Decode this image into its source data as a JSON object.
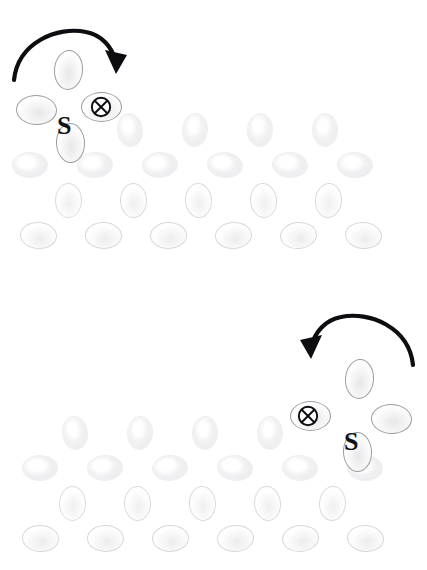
{
  "figure": {
    "width": 427,
    "height": 570,
    "background_color": "#ffffff",
    "panel_count": 2
  },
  "symbols": {
    "s_label": "S",
    "cross_circle_label": "⊗",
    "cross_circle_name": "into-page-vector",
    "stroke_color": "#111115"
  },
  "panels": [
    {
      "id": "panel-top",
      "name": "top-panel",
      "origin_y": 0,
      "arrow": {
        "name": "clockwise-rotation-arrow",
        "direction": "clockwise",
        "head_points": "down-right",
        "start": [
          14,
          77
        ],
        "end": [
          113,
          80
        ],
        "apex": [
          62,
          33
        ]
      },
      "s_marker": {
        "x": 57,
        "y": 113,
        "text": "S"
      },
      "cross_marker": {
        "x": 90,
        "y": 96,
        "text": "⊗"
      },
      "emphasis_cells": [
        {
          "shape": "v",
          "cx": 68,
          "cy": 70
        },
        {
          "shape": "h",
          "cx": 36,
          "cy": 110
        },
        {
          "shape": "h",
          "cx": 101,
          "cy": 107
        },
        {
          "shape": "v",
          "cx": 70,
          "cy": 143
        }
      ],
      "rows": [
        {
          "shape": "v",
          "cy": 130,
          "cxs": [
            130,
            195,
            260,
            325
          ]
        },
        {
          "shape": "h",
          "cy": 165,
          "cxs": [
            30,
            95,
            160,
            225,
            290,
            355
          ]
        },
        {
          "shape": "ov",
          "cy": 200,
          "cxs": [
            68,
            133,
            198,
            263,
            328
          ]
        },
        {
          "shape": "oh",
          "cy": 235,
          "cxs": [
            38,
            103,
            168,
            233,
            298,
            363
          ]
        }
      ]
    },
    {
      "id": "panel-bottom",
      "name": "bottom-panel",
      "origin_y": 285,
      "arrow": {
        "name": "counterclockwise-rotation-arrow",
        "direction": "counter-clockwise",
        "head_points": "down-left",
        "start": [
          413,
          77
        ],
        "end": [
          314,
          80
        ],
        "apex": [
          365,
          33
        ]
      },
      "s_marker": {
        "x": 344,
        "y": 144,
        "text": "S"
      },
      "cross_marker": {
        "x": 297,
        "y": 120,
        "text": "⊗"
      },
      "emphasis_cells": [
        {
          "shape": "v",
          "cx": 359,
          "cy": 94
        },
        {
          "shape": "h",
          "cx": 391,
          "cy": 134
        },
        {
          "shape": "h",
          "cx": 310,
          "cy": 131
        },
        {
          "shape": "v",
          "cx": 357,
          "cy": 167
        }
      ],
      "rows": [
        {
          "shape": "v",
          "cy": 148,
          "cxs": [
            75,
            140,
            205,
            270
          ]
        },
        {
          "shape": "h",
          "cy": 183,
          "cxs": [
            40,
            105,
            170,
            235,
            300,
            365
          ]
        },
        {
          "shape": "ov",
          "cy": 218,
          "cxs": [
            72,
            137,
            202,
            267,
            332
          ]
        },
        {
          "shape": "oh",
          "cy": 253,
          "cxs": [
            40,
            105,
            170,
            235,
            300,
            365
          ]
        }
      ]
    }
  ],
  "chart_data": {
    "type": "diagram",
    "title": "",
    "subtitle": "",
    "annotations": [
      "S",
      "⊗"
    ],
    "series": [
      {
        "name": "top-panel-lattice-rows",
        "values": [
          4,
          6,
          5,
          6
        ]
      },
      {
        "name": "bottom-panel-lattice-rows",
        "values": [
          4,
          6,
          5,
          6
        ]
      }
    ],
    "legend": [],
    "grid": false
  }
}
